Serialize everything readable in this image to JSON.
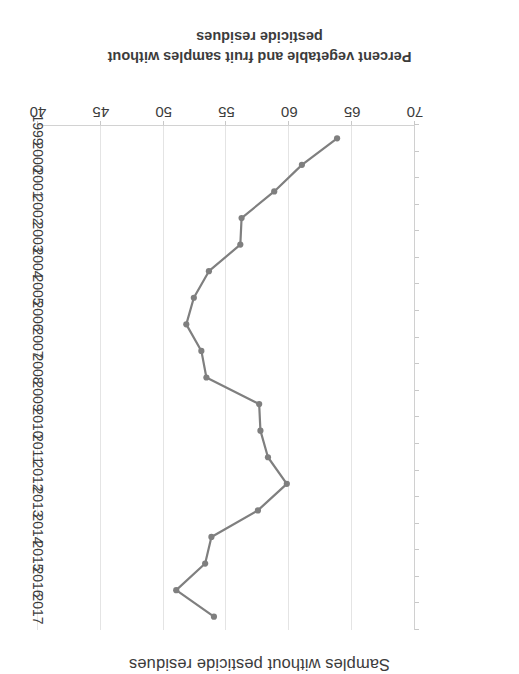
{
  "chart_data": {
    "type": "line",
    "title": "Samples without pesticide residues",
    "xlabel": "",
    "ylabel": "Percent vegetable and fruit samples without pesticide residues",
    "ylabel_lines": [
      "Percent vegetable and fruit samples without",
      "pesticide residues"
    ],
    "orientation": "rotated-180",
    "grid": true,
    "legend": "none",
    "ylim": [
      40,
      70
    ],
    "yticks": [
      70,
      65,
      60,
      55,
      50,
      45,
      40
    ],
    "ytick_labels": [
      "70",
      "65",
      "60",
      "55",
      "50",
      "45",
      "40"
    ],
    "categories": [
      "1999",
      "2000",
      "2001",
      "2002",
      "2003",
      "2004",
      "2005",
      "2006",
      "2007",
      "2008",
      "2009",
      "2010",
      "2011",
      "2012",
      "2013",
      "2014",
      "2015",
      "2016",
      "2017"
    ],
    "values": [
      63.8,
      61.0,
      58.8,
      56.2,
      56.1,
      53.6,
      52.4,
      51.8,
      53.0,
      53.4,
      57.6,
      57.7,
      58.3,
      59.8,
      57.5,
      53.8,
      53.3,
      51.0,
      54.0
    ],
    "series": [
      {
        "name": "Percent vegetable and fruit samples without pesticide residues",
        "color": "#7f7f7f",
        "marker": "circle",
        "values": [
          63.8,
          61.0,
          58.8,
          56.2,
          56.1,
          53.6,
          52.4,
          51.8,
          53.0,
          53.4,
          57.6,
          57.7,
          58.3,
          59.8,
          57.5,
          53.8,
          53.3,
          51.0,
          54.0
        ]
      }
    ]
  },
  "colors": {
    "series_line": "#7f7f7f",
    "gridline": "#e4e4e4",
    "axis": "#d0d0d0",
    "text": "#3c3c3c",
    "background": "#ffffff"
  }
}
